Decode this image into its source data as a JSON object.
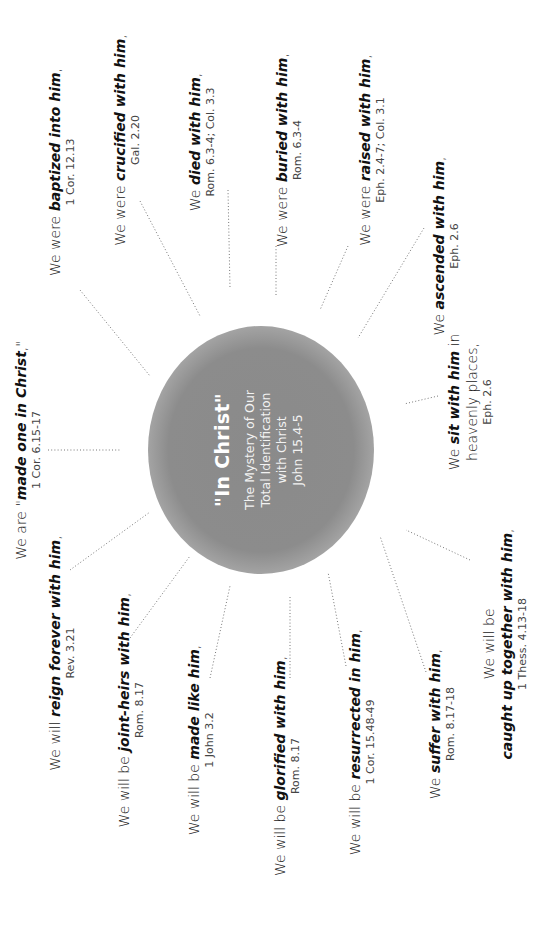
{
  "center": {
    "title": "\"In Christ\"",
    "subtitle_lines": [
      "The Mystery of Our",
      "Total Identification",
      "with Christ",
      "John 15.4-5"
    ]
  },
  "items": [
    {
      "id": "made-one",
      "pre": "We are \"",
      "em": "made one in Christ",
      "post": ",\"",
      "ref": "1 Cor. 6.15-17"
    },
    {
      "id": "baptized",
      "pre": "We were ",
      "em": "baptized into him",
      "post": ",",
      "ref": "1 Cor. 12.13"
    },
    {
      "id": "crucified",
      "pre": "We were ",
      "em": "crucified with him",
      "post": ",",
      "ref": "Gal. 2.20"
    },
    {
      "id": "died",
      "pre": "We ",
      "em": "died with him",
      "post": ",",
      "ref": "Rom. 6.3-4; Col. 3.3"
    },
    {
      "id": "buried",
      "pre": "We were ",
      "em": "buried with him",
      "post": ",",
      "ref": "Rom. 6.3-4"
    },
    {
      "id": "raised",
      "pre": "We were ",
      "em": "raised with him",
      "post": ",",
      "ref": "Eph. 2.4-7; Col. 3.1"
    },
    {
      "id": "ascended",
      "pre": "We ",
      "em": "ascended with him",
      "post": ",",
      "ref": "Eph. 2.6"
    },
    {
      "id": "sit",
      "pre": "We ",
      "em": "sit with him",
      "post": " in",
      "line2": "heavenly places,",
      "ref": "Eph. 2.6"
    },
    {
      "id": "caught-up",
      "line0": "We will be",
      "pre": "",
      "em": "caught up together with him",
      "post": ",",
      "ref": "1 Thess. 4.13-18"
    },
    {
      "id": "suffer",
      "pre": "We ",
      "em": "suffer with him",
      "post": ",",
      "ref": "Rom. 8.17-18"
    },
    {
      "id": "resurrected",
      "pre": "We will be ",
      "em": "resurrected in him",
      "post": ",",
      "ref": "1 Cor. 15.48-49"
    },
    {
      "id": "glorified",
      "pre": "We will be ",
      "em": "glorified with him",
      "post": ",",
      "ref": "Rom. 8.17"
    },
    {
      "id": "made-like",
      "pre": "We will be ",
      "em": "made like him",
      "post": ",",
      "ref": "1 John 3.2"
    },
    {
      "id": "joint-heirs",
      "pre": "We will be ",
      "em": "joint-heirs with him",
      "post": ",",
      "ref": "Rom. 8.17"
    },
    {
      "id": "reign",
      "pre": "We will ",
      "em": "reign forever with him",
      "post": ",",
      "ref": "Rev. 3.21"
    }
  ]
}
